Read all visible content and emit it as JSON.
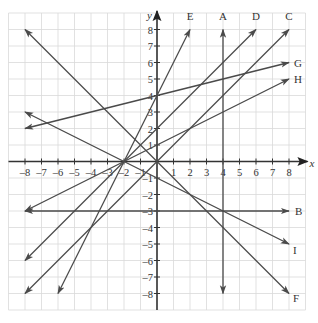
{
  "diagram": {
    "type": "coordinate-grid",
    "axes": {
      "x_label": "x",
      "y_label": "y",
      "x_range": [
        -9,
        9
      ],
      "y_range": [
        -9,
        9
      ],
      "x_ticks": [
        "-8",
        "-7",
        "-6",
        "-5",
        "-4",
        "-3",
        "-2",
        "-1",
        "1",
        "2",
        "3",
        "4",
        "5",
        "6",
        "7",
        "8"
      ],
      "y_ticks": [
        "8",
        "7",
        "6",
        "5",
        "4",
        "3",
        "2",
        "1",
        "-1",
        "-2",
        "-3",
        "-4",
        "-5",
        "-6",
        "-7",
        "-8"
      ]
    },
    "colors": {
      "grid": "#d9d9d9",
      "axis": "#333333",
      "line": "#4a4a4a",
      "background": "#ffffff"
    },
    "lines": [
      {
        "name": "A",
        "from": [
          4,
          -8
        ],
        "to": [
          4,
          8
        ],
        "equation": "x = 4"
      },
      {
        "name": "B",
        "from": [
          -8,
          -3
        ],
        "to": [
          8,
          -3
        ],
        "equation": "y = -3"
      },
      {
        "name": "C",
        "from": [
          -8,
          -8
        ],
        "to": [
          8,
          8
        ],
        "equation": "y = x"
      },
      {
        "name": "D",
        "from": [
          -8,
          -6
        ],
        "to": [
          6,
          8
        ],
        "equation": "y = x + 2"
      },
      {
        "name": "E",
        "from": [
          -6,
          -8
        ],
        "to": [
          2,
          8
        ],
        "equation": "y = 2x + 4"
      },
      {
        "name": "F",
        "from": [
          -8,
          8
        ],
        "to": [
          8,
          -8
        ],
        "equation": "y = -x"
      },
      {
        "name": "G",
        "from": [
          -8,
          2
        ],
        "to": [
          8,
          6
        ],
        "equation": "y = x/4 + 4"
      },
      {
        "name": "H",
        "from": [
          -8,
          -3
        ],
        "to": [
          8,
          5
        ],
        "equation": "y = x/2 + 1"
      },
      {
        "name": "I",
        "from": [
          -8,
          3
        ],
        "to": [
          8,
          -5
        ],
        "equation": "y = -x/2 - 1"
      }
    ]
  }
}
